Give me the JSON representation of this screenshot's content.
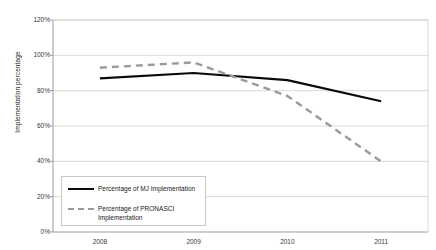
{
  "chart_data": {
    "type": "line",
    "title": "",
    "xlabel": "",
    "ylabel": "Implementation\npercentage",
    "categories": [
      "2008",
      "2009",
      "2010",
      "2011"
    ],
    "x": [
      2008,
      2009,
      2010,
      2011
    ],
    "ylim": [
      0,
      120
    ],
    "ytick_labels": [
      "0%",
      "20%",
      "40%",
      "60%",
      "80%",
      "100%",
      "120%"
    ],
    "ytick_values": [
      0,
      20,
      40,
      60,
      80,
      100,
      120
    ],
    "grid": true,
    "grid_axis": "y",
    "legend_position": "lower-left-inside",
    "series": [
      {
        "name": "Percentage of MJ Implementation",
        "style": "solid",
        "color": "#0a0a0a",
        "values": [
          87,
          90,
          86,
          74
        ]
      },
      {
        "name": "Percentage of PRONASCI\nImplementation",
        "style": "dashed",
        "color": "#9a9a9a",
        "values": [
          93,
          96,
          77,
          40
        ]
      }
    ]
  },
  "axis": {
    "y_title": "Implementation\npercentage",
    "y_ticks": [
      "120%",
      "100%",
      "80%",
      "60%",
      "40%",
      "20%",
      "0%"
    ],
    "x_ticks": [
      "2008",
      "2009",
      "2010",
      "2011"
    ]
  },
  "legend": {
    "items": [
      {
        "label": "Percentage of MJ Implementation"
      },
      {
        "label": "Percentage of  PRONASCI\nImplementation"
      }
    ]
  },
  "colors": {
    "series_mj": "#0a0a0a",
    "series_pronasci": "#9a9a9a",
    "gridline": "#cfcfcf",
    "axis": "#9d9d9d",
    "background": "#ffffff"
  }
}
